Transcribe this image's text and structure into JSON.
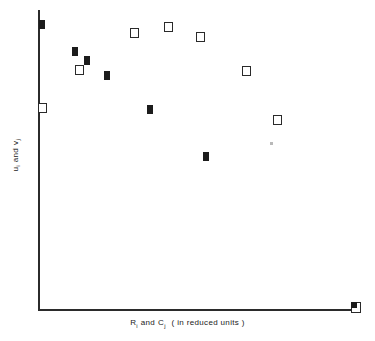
{
  "chart": {
    "type": "scatter",
    "title": "",
    "xlabel_text": "R i and C j ( in reduced units )",
    "ylabel_text": "u i and v j",
    "xlabel_parts": {
      "var1": "R",
      "sub1": "i",
      "conj": "and",
      "var2": "C",
      "sub2": "j",
      "units": "( in reduced units )"
    },
    "ylabel_parts": {
      "var1": "u",
      "sub1": "i",
      "conj": "and",
      "var2": "v",
      "sub2": "j"
    },
    "axis_color": "#2b2b2b",
    "marker_filled_color": "#1c1c1c",
    "marker_open_color": "#2a2a2a",
    "background": "#ffffff"
  },
  "chart_data": {
    "type": "scatter",
    "title": "",
    "xlabel": "R_i and C_j ( in reduced units )",
    "ylabel": "u_i and v_j",
    "grid": false,
    "legend": "none",
    "axis_ticks": {
      "x": [],
      "y": []
    },
    "xlim": [
      0,
      100
    ],
    "ylim": [
      0,
      100
    ],
    "note": "Axes are unlabeled (no tick values shown); values below are normalized 0-100 positions read off the plot frame.",
    "series": [
      {
        "name": "u_i (filled squares)",
        "marker": "filled-square",
        "color": "#1c1c1c",
        "points": [
          {
            "x": 0.9,
            "y": 95.3
          },
          {
            "x": 11.3,
            "y": 86.7
          },
          {
            "x": 15.0,
            "y": 83.7
          },
          {
            "x": 21.3,
            "y": 78.7
          },
          {
            "x": 34.7,
            "y": 68.0
          },
          {
            "x": 52.2,
            "y": 52.3
          },
          {
            "x": 99.4,
            "y": 2.0
          }
        ]
      },
      {
        "name": "v_j (open squares)",
        "marker": "open-square",
        "color": "#2a2a2a",
        "points": [
          {
            "x": 1.6,
            "y": 68.7
          },
          {
            "x": 12.5,
            "y": 80.0
          },
          {
            "x": 30.0,
            "y": 92.3
          },
          {
            "x": 40.6,
            "y": 94.3
          },
          {
            "x": 50.6,
            "y": 91.0
          },
          {
            "x": 65.0,
            "y": 79.7
          },
          {
            "x": 74.7,
            "y": 63.3
          },
          {
            "x": 99.4,
            "y": 2.0
          }
        ]
      },
      {
        "name": "scan-artifact",
        "marker": "speck",
        "color": "#b9b9b9",
        "points": [
          {
            "x": 73.1,
            "y": 55.3
          }
        ]
      }
    ]
  },
  "markers": {
    "filled": [
      {
        "name": "filled-1",
        "left": 1,
        "top": 10
      },
      {
        "name": "filled-2",
        "left": 34,
        "top": 37
      },
      {
        "name": "filled-3",
        "left": 46,
        "top": 46
      },
      {
        "name": "filled-4",
        "left": 66,
        "top": 61
      },
      {
        "name": "filled-5",
        "left": 109,
        "top": 95
      },
      {
        "name": "filled-6",
        "left": 165,
        "top": 142
      }
    ],
    "open": [
      {
        "name": "open-1",
        "left": 0,
        "top": 93
      },
      {
        "name": "open-2",
        "left": 37,
        "top": 55
      },
      {
        "name": "open-3",
        "left": 92,
        "top": 18
      },
      {
        "name": "open-4",
        "left": 126,
        "top": 12
      },
      {
        "name": "open-5",
        "left": 158,
        "top": 22
      },
      {
        "name": "open-6",
        "left": 204,
        "top": 56
      },
      {
        "name": "open-7",
        "left": 235,
        "top": 105
      }
    ],
    "combo": [
      {
        "name": "combo-bottom-right",
        "left": 313,
        "top": 292
      }
    ],
    "speck": [
      {
        "name": "speck-1",
        "left": 232,
        "top": 132
      }
    ]
  }
}
